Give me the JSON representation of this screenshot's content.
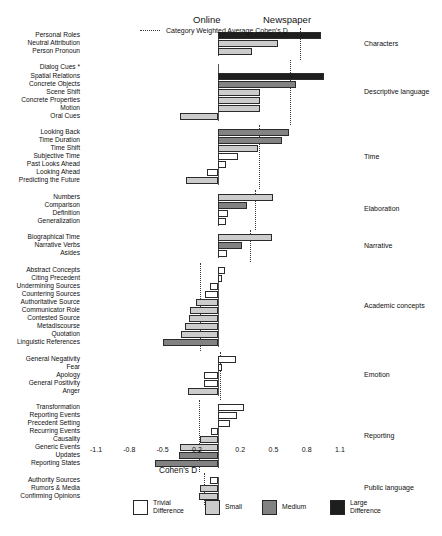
{
  "headers": {
    "online": "Online",
    "newspaper": "Newspaper"
  },
  "legend": {
    "items": [
      {
        "label": "Trivial\nDifference",
        "color": "#ffffff",
        "key": "trivial"
      },
      {
        "label": "Small",
        "color": "#cccccc",
        "key": "small"
      },
      {
        "label": "Medium",
        "color": "#828282",
        "key": "medium"
      },
      {
        "label": "Large\nDifference",
        "color": "#1e1e1e",
        "key": "large"
      }
    ],
    "dotted_label": "Category Weighted Average Cohen's D"
  },
  "chart_data": {
    "type": "bar",
    "orientation": "horizontal",
    "title": "",
    "xlabel": "Cohen's D",
    "ylabel": "",
    "xlim": [
      -1.1,
      1.1
    ],
    "xticks": [
      -1.1,
      -0.8,
      -0.5,
      -0.2,
      0.2,
      0.5,
      0.8,
      1.1
    ],
    "xtick_labels": [
      "-1.1",
      "-0.8",
      "-0.5",
      "-0.2",
      "0.2",
      "0.5",
      "0.8",
      "1.1"
    ],
    "grid": false,
    "legend_position": "bottom",
    "left_side_label": "Online",
    "right_side_label": "Newspaper",
    "effect_size_bands": {
      "trivial": "Trivial Difference",
      "small": "Small",
      "medium": "Medium",
      "large": "Large Difference"
    },
    "groups": [
      {
        "name": "Characters",
        "weighted_average": 0.74,
        "bars": [
          {
            "label": "Personal Roles",
            "value": 0.93,
            "size": "large"
          },
          {
            "label": "Neutral Attribution",
            "value": 0.54,
            "size": "small"
          },
          {
            "label": "Person Pronoun",
            "value": 0.31,
            "size": "small"
          }
        ]
      },
      {
        "name": "Descriptive language",
        "weighted_average": 0.65,
        "bars": [
          {
            "label": "Dialog Cues *",
            "value": 0.0,
            "size": "trivial"
          },
          {
            "label": "Spatial Relations",
            "value": 0.96,
            "size": "large"
          },
          {
            "label": "Concrete Objects",
            "value": 0.7,
            "size": "medium"
          },
          {
            "label": "Scene Shift",
            "value": 0.38,
            "size": "small"
          },
          {
            "label": "Concrete Properties",
            "value": 0.38,
            "size": "small"
          },
          {
            "label": "Motion",
            "value": 0.38,
            "size": "small"
          },
          {
            "label": "Oral Cues",
            "value": -0.34,
            "size": "small"
          }
        ]
      },
      {
        "name": "Time",
        "weighted_average": 0.37,
        "bars": [
          {
            "label": "Looking Back",
            "value": 0.64,
            "size": "medium"
          },
          {
            "label": "Time Duration",
            "value": 0.58,
            "size": "medium"
          },
          {
            "label": "Time Shift",
            "value": 0.36,
            "size": "small"
          },
          {
            "label": "Subjective Time",
            "value": 0.18,
            "size": "trivial"
          },
          {
            "label": "Past Looks Ahead",
            "value": 0.07,
            "size": "trivial"
          },
          {
            "label": "Looking Ahead",
            "value": -0.1,
            "size": "trivial"
          },
          {
            "label": "Predicting the Future",
            "value": -0.29,
            "size": "small"
          }
        ]
      },
      {
        "name": "Elaboration",
        "weighted_average": 0.33,
        "bars": [
          {
            "label": "Numbers",
            "value": 0.5,
            "size": "small"
          },
          {
            "label": "Comparison",
            "value": 0.26,
            "size": "medium"
          },
          {
            "label": "Definition",
            "value": 0.09,
            "size": "trivial"
          },
          {
            "label": "Generalization",
            "value": 0.07,
            "size": "trivial"
          }
        ]
      },
      {
        "name": "Narrative",
        "weighted_average": 0.29,
        "bars": [
          {
            "label": "Biographical Time",
            "value": 0.49,
            "size": "small"
          },
          {
            "label": "Narrative Verbs",
            "value": 0.22,
            "size": "medium"
          },
          {
            "label": "Asides",
            "value": 0.08,
            "size": "trivial"
          }
        ]
      },
      {
        "name": "Academic concepts",
        "weighted_average": -0.16,
        "bars": [
          {
            "label": "Abstract Concepts",
            "value": 0.06,
            "size": "trivial"
          },
          {
            "label": "Citing Precedent",
            "value": 0.04,
            "size": "trivial"
          },
          {
            "label": "Undermining Sources",
            "value": -0.07,
            "size": "trivial"
          },
          {
            "label": "Countering Sources",
            "value": -0.12,
            "size": "trivial"
          },
          {
            "label": "Authoritative Source",
            "value": -0.2,
            "size": "small"
          },
          {
            "label": "Communicator Role",
            "value": -0.25,
            "size": "small"
          },
          {
            "label": "Contested Source",
            "value": -0.26,
            "size": "small"
          },
          {
            "label": "Metadiscourse",
            "value": -0.3,
            "size": "small"
          },
          {
            "label": "Quotation",
            "value": -0.33,
            "size": "small"
          },
          {
            "label": "Linguistic References",
            "value": -0.5,
            "size": "medium"
          }
        ]
      },
      {
        "name": "Emotion",
        "weighted_average": 0.02,
        "bars": [
          {
            "label": "General Negativity",
            "value": 0.16,
            "size": "trivial"
          },
          {
            "label": "Fear",
            "value": 0.04,
            "size": "trivial"
          },
          {
            "label": "Apology",
            "value": -0.13,
            "size": "trivial"
          },
          {
            "label": "General Positivity",
            "value": -0.13,
            "size": "trivial"
          },
          {
            "label": "Anger",
            "value": -0.27,
            "size": "small"
          }
        ]
      },
      {
        "name": "Reporting",
        "weighted_average": -0.17,
        "bars": [
          {
            "label": "Transformation",
            "value": 0.23,
            "size": "trivial"
          },
          {
            "label": "Reporting Events",
            "value": 0.17,
            "size": "trivial"
          },
          {
            "label": "Precedent Setting",
            "value": 0.11,
            "size": "trivial"
          },
          {
            "label": "Recurring Events",
            "value": -0.06,
            "size": "trivial"
          },
          {
            "label": "Causality",
            "value": -0.16,
            "size": "small"
          },
          {
            "label": "Generic Events",
            "value": -0.34,
            "size": "small"
          },
          {
            "label": "Updates",
            "value": -0.35,
            "size": "medium"
          },
          {
            "label": "Reporting States",
            "value": -0.57,
            "size": "medium"
          }
        ]
      },
      {
        "name": "Public language",
        "weighted_average": -0.13,
        "bars": [
          {
            "label": "Authority Sources",
            "value": -0.07,
            "size": "trivial"
          },
          {
            "label": "Rumors & Media",
            "value": -0.16,
            "size": "small"
          },
          {
            "label": "Confirming Opinions",
            "value": -0.17,
            "size": "small"
          }
        ]
      }
    ]
  }
}
